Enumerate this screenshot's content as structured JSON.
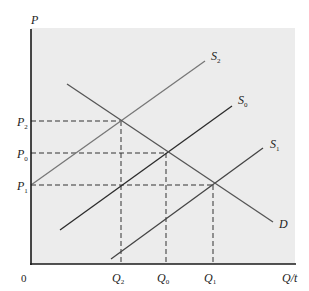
{
  "diagram": {
    "title": "",
    "axes": {
      "y_label": "P",
      "x_label": "Q/t",
      "origin_label": "0"
    },
    "price_labels": [
      {
        "name": "P",
        "sub": "2"
      },
      {
        "name": "P",
        "sub": "0"
      },
      {
        "name": "P",
        "sub": "1"
      }
    ],
    "quantity_labels": [
      {
        "name": "Q",
        "sub": "2"
      },
      {
        "name": "Q",
        "sub": "0"
      },
      {
        "name": "Q",
        "sub": "1"
      }
    ],
    "curves": [
      {
        "id": "S2",
        "name": "S",
        "sub": "2",
        "type": "supply"
      },
      {
        "id": "S0",
        "name": "S",
        "sub": "0",
        "type": "supply"
      },
      {
        "id": "S1",
        "name": "S",
        "sub": "1",
        "type": "supply"
      },
      {
        "id": "D",
        "name": "D",
        "sub": "",
        "type": "demand"
      }
    ],
    "colors": {
      "panel": "#ececec",
      "axis": "#1a1a1a",
      "supply_s2": "#777777",
      "supply_s0": "#2b2b2b",
      "supply_s1": "#444444",
      "demand": "#555555",
      "dashed": "#333333"
    }
  }
}
